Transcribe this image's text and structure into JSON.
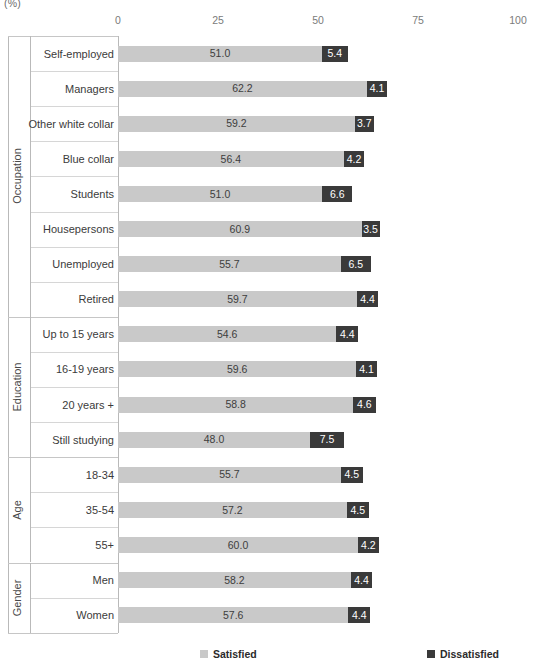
{
  "chart_data": {
    "type": "bar",
    "orientation": "horizontal",
    "stacked": true,
    "title": "",
    "unit_label": "(%)",
    "xlabel": "",
    "ylabel": "",
    "xlim": [
      0,
      100
    ],
    "xticks": [
      0,
      25,
      50,
      75,
      100
    ],
    "xtick_labels": [
      "0",
      "25",
      "50",
      "75",
      "100"
    ],
    "grid": false,
    "legend_position": "bottom",
    "legend": [
      {
        "name": "Satisfied",
        "color": "#c9c9c9"
      },
      {
        "name": "Dissatisfied",
        "color": "#3a3a3a"
      }
    ],
    "series": [
      {
        "name": "Satisfied",
        "color": "#c9c9c9",
        "values": [
          51.0,
          62.2,
          59.2,
          56.4,
          51.0,
          60.9,
          55.7,
          59.7,
          54.6,
          59.6,
          58.8,
          48.0,
          55.7,
          57.2,
          60.0,
          58.2,
          57.6
        ]
      },
      {
        "name": "Dissatisfied",
        "color": "#3a3a3a",
        "values": [
          5.4,
          4.1,
          3.7,
          4.2,
          6.6,
          3.5,
          6.5,
          4.4,
          4.4,
          4.1,
          4.6,
          7.5,
          4.5,
          4.5,
          4.2,
          4.4,
          4.4
        ]
      }
    ],
    "categories": [
      "Self-employed",
      "Managers",
      "Other white collar",
      "Blue collar",
      "Students",
      "Housepersons",
      "Unemployed",
      "Retired",
      "Up to 15 years",
      "16-19 years",
      "20 years +",
      "Still studying",
      "18-34",
      "35-54",
      "55+",
      "Men",
      "Women"
    ],
    "groups": [
      {
        "title": "Occupation",
        "categories": [
          "Self-employed",
          "Managers",
          "Other white collar",
          "Blue collar",
          "Students",
          "Housepersons",
          "Unemployed",
          "Retired"
        ]
      },
      {
        "title": "Education",
        "categories": [
          "Up to 15 years",
          "16-19 years",
          "20 years +",
          "Still studying"
        ]
      },
      {
        "title": "Age",
        "categories": [
          "18-34",
          "35-54",
          "55+"
        ]
      },
      {
        "title": "Gender",
        "categories": [
          "Men",
          "Women"
        ]
      }
    ],
    "rows": [
      {
        "group": "Occupation",
        "label": "Self-employed",
        "satisfied": 51.0,
        "dissatisfied": 5.4,
        "satisfied_label": "51.0",
        "dissatisfied_label": "5.4"
      },
      {
        "group": "Occupation",
        "label": "Managers",
        "satisfied": 62.2,
        "dissatisfied": 4.1,
        "satisfied_label": "62.2",
        "dissatisfied_label": "4.1"
      },
      {
        "group": "Occupation",
        "label": "Other white collar",
        "satisfied": 59.2,
        "dissatisfied": 3.7,
        "satisfied_label": "59.2",
        "dissatisfied_label": "3.7"
      },
      {
        "group": "Occupation",
        "label": "Blue collar",
        "satisfied": 56.4,
        "dissatisfied": 4.2,
        "satisfied_label": "56.4",
        "dissatisfied_label": "4.2"
      },
      {
        "group": "Occupation",
        "label": "Students",
        "satisfied": 51.0,
        "dissatisfied": 6.6,
        "satisfied_label": "51.0",
        "dissatisfied_label": "6.6"
      },
      {
        "group": "Occupation",
        "label": "Housepersons",
        "satisfied": 60.9,
        "dissatisfied": 3.5,
        "satisfied_label": "60.9",
        "dissatisfied_label": "3.5"
      },
      {
        "group": "Occupation",
        "label": "Unemployed",
        "satisfied": 55.7,
        "dissatisfied": 6.5,
        "satisfied_label": "55.7",
        "dissatisfied_label": "6.5"
      },
      {
        "group": "Occupation",
        "label": "Retired",
        "satisfied": 59.7,
        "dissatisfied": 4.4,
        "satisfied_label": "59.7",
        "dissatisfied_label": "4.4"
      },
      {
        "group": "Education",
        "label": "Up to 15 years",
        "satisfied": 54.6,
        "dissatisfied": 4.4,
        "satisfied_label": "54.6",
        "dissatisfied_label": "4.4"
      },
      {
        "group": "Education",
        "label": "16-19 years",
        "satisfied": 59.6,
        "dissatisfied": 4.1,
        "satisfied_label": "59.6",
        "dissatisfied_label": "4.1"
      },
      {
        "group": "Education",
        "label": "20 years +",
        "satisfied": 58.8,
        "dissatisfied": 4.6,
        "satisfied_label": "58.8",
        "dissatisfied_label": "4.6"
      },
      {
        "group": "Education",
        "label": "Still studying",
        "satisfied": 48.0,
        "dissatisfied": 7.5,
        "satisfied_label": "48.0",
        "dissatisfied_label": "7.5"
      },
      {
        "group": "Age",
        "label": "18-34",
        "satisfied": 55.7,
        "dissatisfied": 4.5,
        "satisfied_label": "55.7",
        "dissatisfied_label": "4.5"
      },
      {
        "group": "Age",
        "label": "35-54",
        "satisfied": 57.2,
        "dissatisfied": 4.5,
        "satisfied_label": "57.2",
        "dissatisfied_label": "4.5"
      },
      {
        "group": "Age",
        "label": "55+",
        "satisfied": 60.0,
        "dissatisfied": 4.2,
        "satisfied_label": "60.0",
        "dissatisfied_label": "4.2"
      },
      {
        "group": "Gender",
        "label": "Men",
        "satisfied": 58.2,
        "dissatisfied": 4.4,
        "satisfied_label": "58.2",
        "dissatisfied_label": "4.4"
      },
      {
        "group": "Gender",
        "label": "Women",
        "satisfied": 57.6,
        "dissatisfied": 4.4,
        "satisfied_label": "57.6",
        "dissatisfied_label": "4.4"
      }
    ]
  },
  "colors": {
    "satisfied": "#c9c9c9",
    "dissatisfied": "#3a3a3a",
    "axis": "#b9b9b9",
    "separator": "#c6c6c6",
    "text": "#3b3b3b"
  }
}
